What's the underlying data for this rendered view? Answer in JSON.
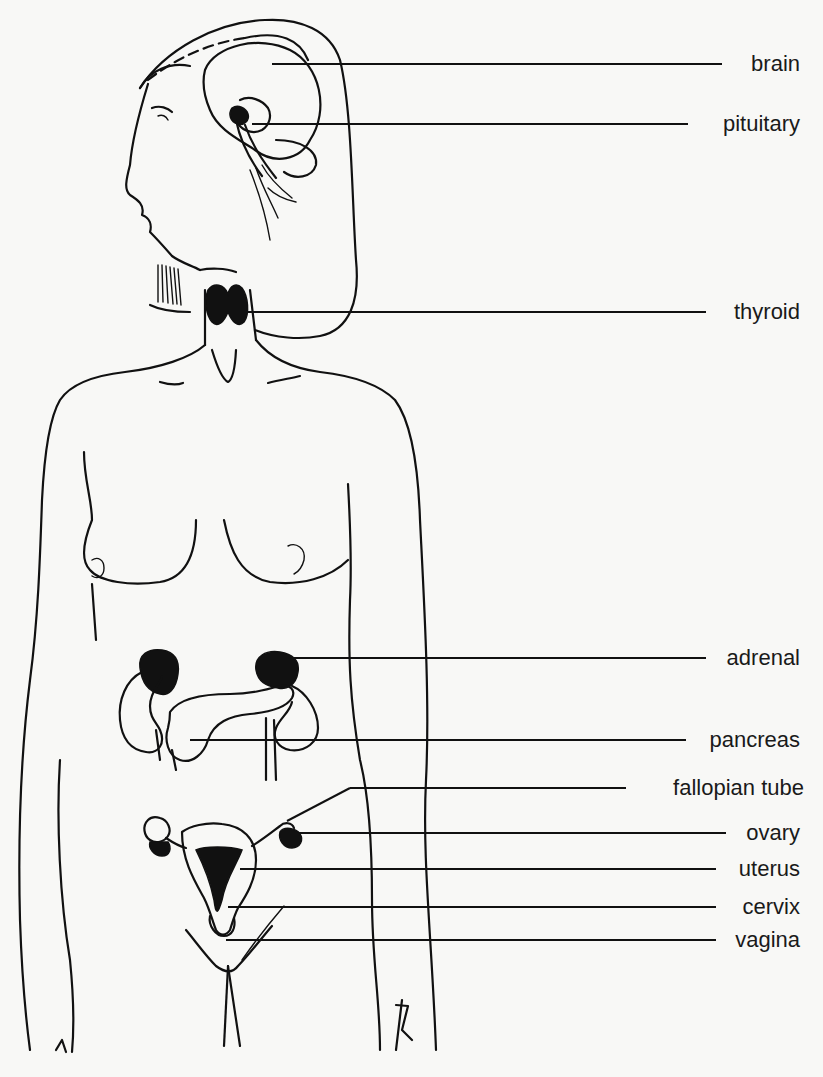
{
  "diagram": {
    "labels": [
      {
        "id": "brain",
        "text": "brain",
        "y": 64,
        "line_x1": 272,
        "line_x2": 722,
        "label_right": 800
      },
      {
        "id": "pituitary",
        "text": "pituitary",
        "y": 124,
        "line_x1": 252,
        "line_x2": 688,
        "label_right": 800
      },
      {
        "id": "thyroid",
        "text": "thyroid",
        "y": 312,
        "line_x1": 246,
        "line_x2": 706,
        "label_right": 800
      },
      {
        "id": "adrenal",
        "text": "adrenal",
        "y": 658,
        "line_x1": 290,
        "line_x2": 706,
        "label_right": 800
      },
      {
        "id": "pancreas",
        "text": "pancreas",
        "y": 740,
        "line_x1": 190,
        "line_x2": 686,
        "label_right": 800
      },
      {
        "id": "fallopian-tube",
        "text": "fallopian tube",
        "y": 788,
        "line_x1": 350,
        "line_x2": 626,
        "label_right": 804,
        "diagonal_from": [
          287,
          821
        ]
      },
      {
        "id": "ovary",
        "text": "ovary",
        "y": 833,
        "line_x1": 298,
        "line_x2": 726,
        "label_right": 800
      },
      {
        "id": "uterus",
        "text": "uterus",
        "y": 869,
        "line_x1": 240,
        "line_x2": 716,
        "label_right": 800
      },
      {
        "id": "cervix",
        "text": "cervix",
        "y": 907,
        "line_x1": 228,
        "line_x2": 716,
        "label_right": 800
      },
      {
        "id": "vagina",
        "text": "vagina",
        "y": 940,
        "line_x1": 226,
        "line_x2": 716,
        "label_right": 800
      }
    ]
  }
}
